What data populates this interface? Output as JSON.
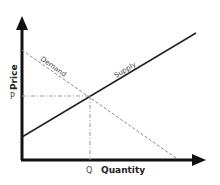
{
  "diagram": {
    "axes": {
      "y_label": "Price",
      "x_label": "Quantity"
    },
    "curves": {
      "demand_label": "Demand",
      "supply_label": "Supply"
    },
    "equilibrium": {
      "price_label": "P",
      "quantity_label": "Q"
    },
    "colors": {
      "axis": "#111111",
      "supply": "#222222",
      "demand": "#888888",
      "guide": "#999999",
      "text": "#333333"
    }
  }
}
